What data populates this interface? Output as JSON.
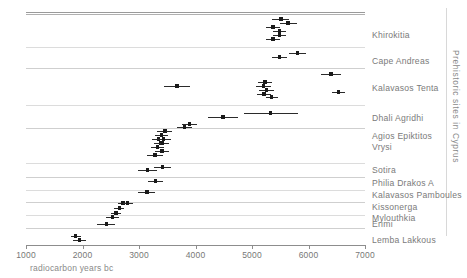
{
  "figure": {
    "side_title": "Prehistoric sites in Cyprus",
    "axis_caption": "radiocarbon years bc"
  },
  "chart_data": {
    "type": "scatter",
    "title": "Prehistoric sites in Cyprus",
    "xlabel": "radiocarbon years bc",
    "ylabel": "",
    "xlim": [
      1000,
      7000
    ],
    "xticks": [
      1000,
      2000,
      3000,
      4000,
      5000,
      6000,
      7000
    ],
    "xtick_labels": [
      "1000",
      "2000",
      "3000",
      "4000",
      "5000",
      "6000",
      "7000"
    ],
    "grid": false,
    "legend": "none",
    "note": "Horizontal dot-and-error-bar plot of radiocarbon determinations grouped by archaeological site; x values are radiocarbon years bc, err is the half-width of the plotted error bar in radiocarbon years.",
    "categories": [
      "Khirokitia",
      "Cape Andreas",
      "Kalavasos Tenta",
      "Dhali Agridhi",
      "Agios Epiktitos Vrysi",
      "Sotira",
      "Philia Drakos A",
      "Kalavasos Pamboules",
      "Kissonerga Mylouthkia",
      "Erimi",
      "Lemba Lakkous"
    ],
    "groups": [
      {
        "label": "Khirokitia",
        "label_lines": [
          "Khirokitia"
        ],
        "points": [
          {
            "x": 5510,
            "err": 150
          },
          {
            "x": 5640,
            "err": 150
          },
          {
            "x": 5370,
            "err": 120
          },
          {
            "x": 5490,
            "err": 110
          },
          {
            "x": 5490,
            "err": 110
          },
          {
            "x": 5370,
            "err": 120
          }
        ]
      },
      {
        "label": "Cape Andreas",
        "label_lines": [
          "Cape Andreas"
        ],
        "points": [
          {
            "x": 5490,
            "err": 130
          },
          {
            "x": 5810,
            "err": 150
          }
        ]
      },
      {
        "label": "Kalavasos Tenta",
        "label_lines": [
          "Kalavasos Tenta"
        ],
        "points": [
          {
            "x": 6400,
            "err": 170
          },
          {
            "x": 3670,
            "err": 230
          },
          {
            "x": 5230,
            "err": 120
          },
          {
            "x": 5200,
            "err": 130
          },
          {
            "x": 5260,
            "err": 130
          },
          {
            "x": 5210,
            "err": 120
          },
          {
            "x": 5350,
            "err": 110
          },
          {
            "x": 6530,
            "err": 120
          }
        ]
      },
      {
        "label": "Dhali Agridhi",
        "label_lines": [
          "Dhali Agridhi"
        ],
        "points": [
          {
            "x": 4490,
            "err": 260
          },
          {
            "x": 5330,
            "err": 480
          }
        ]
      },
      {
        "label": "Agios Epiktitos Vrysi",
        "label_lines": [
          "Agios Epiktitos",
          "Vrysi"
        ],
        "points": [
          {
            "x": 3800,
            "err": 130
          },
          {
            "x": 3890,
            "err": 130
          },
          {
            "x": 3460,
            "err": 130
          },
          {
            "x": 3400,
            "err": 120
          },
          {
            "x": 3350,
            "err": 120
          },
          {
            "x": 3450,
            "err": 130
          },
          {
            "x": 3390,
            "err": 120
          },
          {
            "x": 3330,
            "err": 120
          },
          {
            "x": 3430,
            "err": 130
          },
          {
            "x": 3420,
            "err": 120
          },
          {
            "x": 3410,
            "err": 120
          },
          {
            "x": 3280,
            "err": 140
          }
        ]
      },
      {
        "label": "Sotira",
        "label_lines": [
          "Sotira"
        ],
        "points": [
          {
            "x": 3150,
            "err": 160
          },
          {
            "x": 3420,
            "err": 150
          }
        ]
      },
      {
        "label": "Philia Drakos A",
        "label_lines": [
          "Philia Drakos A"
        ],
        "points": [
          {
            "x": 3290,
            "err": 130
          }
        ]
      },
      {
        "label": "Kalavasos Pamboules",
        "label_lines": [
          "Kalavasos Pamboules"
        ],
        "points": [
          {
            "x": 3140,
            "err": 150
          }
        ]
      },
      {
        "label": "Kissonerga Mylouthkia",
        "label_lines": [
          "Kissonerga",
          "Mylouthkia"
        ],
        "points": [
          {
            "x": 2720,
            "err": 90
          },
          {
            "x": 2800,
            "err": 90
          },
          {
            "x": 2650,
            "err": 90
          },
          {
            "x": 2590,
            "err": 90
          },
          {
            "x": 2530,
            "err": 110
          }
        ]
      },
      {
        "label": "Erimi",
        "label_lines": [
          "Erimi"
        ],
        "points": [
          {
            "x": 2420,
            "err": 160
          }
        ]
      },
      {
        "label": "Lemba Lakkous",
        "label_lines": [
          "Lemba Lakkous"
        ],
        "points": [
          {
            "x": 1880,
            "err": 90
          },
          {
            "x": 1950,
            "err": 120
          }
        ]
      }
    ],
    "separator_rows": [
      14,
      47,
      68,
      105,
      128,
      163,
      177,
      190,
      202,
      215,
      228
    ]
  }
}
